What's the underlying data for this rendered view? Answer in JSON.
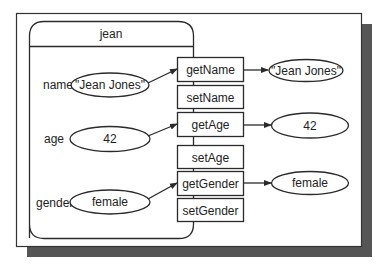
{
  "object": {
    "name": "jean",
    "fields": [
      {
        "label": "name",
        "value": "\"Jean Jones\""
      },
      {
        "label": "age",
        "value": "42"
      },
      {
        "label": "gender",
        "value": "female"
      }
    ]
  },
  "methods": [
    {
      "label": "getName"
    },
    {
      "label": "setName"
    },
    {
      "label": "getAge"
    },
    {
      "label": "setAge"
    },
    {
      "label": "getGender"
    },
    {
      "label": "setGender"
    }
  ],
  "returns": [
    {
      "from": "getName",
      "value": "\"Jean Jones\""
    },
    {
      "from": "getAge",
      "value": "42"
    },
    {
      "from": "getGender",
      "value": "female"
    }
  ],
  "colors": {
    "shadow": "#555555",
    "stroke": "#2a2a2a",
    "background": "#ffffff"
  }
}
